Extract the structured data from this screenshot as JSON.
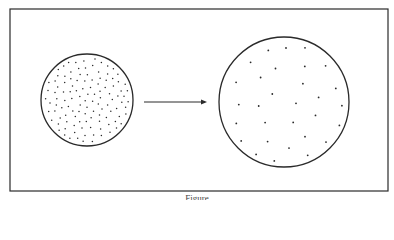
{
  "figure": {
    "caption": "Figure",
    "colors": {
      "line": "#2a2a2a",
      "dot": "#2a2a2a",
      "background": "#ffffff"
    },
    "frame": {
      "x": 10,
      "y": 9,
      "width": 378,
      "height": 182
    },
    "left_circle": {
      "cx": 87,
      "cy": 100,
      "r": 46,
      "dot_count": 130,
      "label": "dense"
    },
    "right_circle": {
      "cx": 284,
      "cy": 102,
      "r": 65,
      "dot_count": 30,
      "label": "sparse"
    },
    "arrow": {
      "x1": 144,
      "y1": 102,
      "x2": 207,
      "y2": 102
    }
  }
}
